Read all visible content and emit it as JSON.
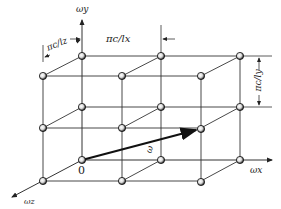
{
  "diagram": {
    "type": "lattice-3d",
    "axes": {
      "x": "ωx",
      "y": "ωy",
      "z": "ωz"
    },
    "origin_label": "0",
    "vector_label": "ω",
    "spacings": {
      "x": "πc/lx",
      "y": "πc/ly",
      "z": "πc/lz"
    },
    "colors": {
      "line": "#333333",
      "node_fill": "#ffffff",
      "node_stroke": "#111111",
      "vector": "#111111"
    }
  }
}
